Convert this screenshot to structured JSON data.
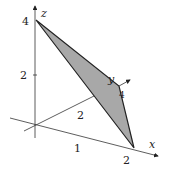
{
  "diagram": {
    "type": "3d-axes-plane",
    "axes": {
      "x_label": "x",
      "y_label": "y",
      "z_label": "z"
    },
    "ticks": {
      "z_4": "4",
      "z_2": "2",
      "x_1": "1",
      "x_2": "2",
      "y_2": "2",
      "y_4": "4"
    },
    "plane": {
      "vertices": [
        "(2,0,0)",
        "(0,4,0)",
        "(0,0,4)"
      ],
      "fill": "#a8a8a8",
      "stroke": "#222222"
    }
  }
}
